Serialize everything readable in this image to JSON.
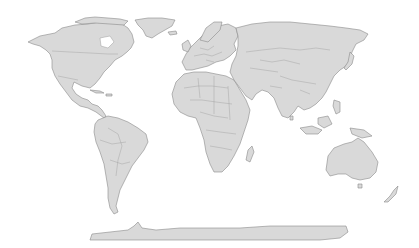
{
  "map": {
    "projection": "world-equirectangular",
    "land_color": "#d9d9d9",
    "border_color": "#8a8a8a",
    "ocean_color": "#ffffff",
    "regions": [
      {
        "name": "north-america"
      },
      {
        "name": "greenland"
      },
      {
        "name": "south-america"
      },
      {
        "name": "europe"
      },
      {
        "name": "africa"
      },
      {
        "name": "asia"
      },
      {
        "name": "australia"
      },
      {
        "name": "antarctica"
      }
    ]
  }
}
